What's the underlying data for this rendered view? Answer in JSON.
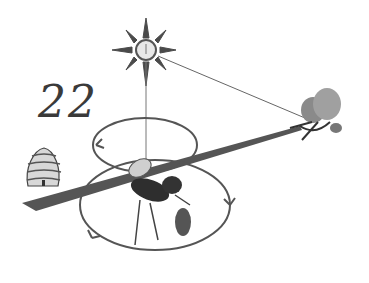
{
  "figure": {
    "angle_label": "22",
    "elements": [
      "sun",
      "hive",
      "bee",
      "clover-flower",
      "dance-path-arrows",
      "sun-to-flower-line",
      "hive-to-flower-line"
    ]
  },
  "colors": {
    "ink": "#3a3a3a",
    "shade": "#6b6b6b",
    "light": "#bdbdbd",
    "background": "#ffffff"
  }
}
